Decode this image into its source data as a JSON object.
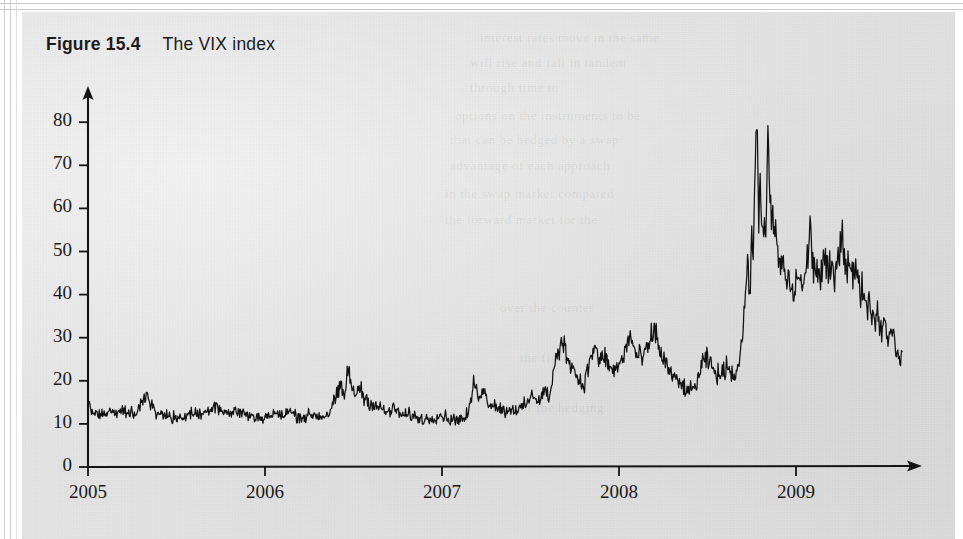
{
  "page": {
    "background_color": "#e3e3e3",
    "margin_color": "#ffffff",
    "ink_color": "#141414"
  },
  "figure": {
    "label": "Figure 15.4",
    "caption": "The VIX index"
  },
  "ghost_text": [
    {
      "text": "interest rates move in the same",
      "x": 480,
      "y": 30
    },
    {
      "text": "will rise and fall in tandem",
      "x": 470,
      "y": 55
    },
    {
      "text": "through time to",
      "x": 470,
      "y": 80
    },
    {
      "text": "options on the instruments to be",
      "x": 455,
      "y": 108
    },
    {
      "text": "that can be hedged by a swap",
      "x": 450,
      "y": 132
    },
    {
      "text": "advantage of each approach",
      "x": 450,
      "y": 158
    },
    {
      "text": "in the swap market compared",
      "x": 445,
      "y": 186
    },
    {
      "text": "the forward market for the",
      "x": 445,
      "y": 212
    },
    {
      "text": "over the counter",
      "x": 500,
      "y": 300
    },
    {
      "text": "the firm",
      "x": 520,
      "y": 350
    },
    {
      "text": "under the hedging",
      "x": 500,
      "y": 400
    }
  ],
  "chart_data": {
    "type": "line",
    "title": "The VIX index",
    "xlabel": "",
    "ylabel": "",
    "grid": false,
    "legend": null,
    "x_ticks": [
      "2005",
      "2006",
      "2007",
      "2008",
      "2009"
    ],
    "x_tick_values": [
      2005,
      2006,
      2007,
      2008,
      2009
    ],
    "y_ticks": [
      0,
      10,
      20,
      30,
      40,
      50,
      60,
      70,
      80
    ],
    "xlim": [
      2005.0,
      2009.6
    ],
    "ylim": [
      0,
      88
    ],
    "series_name": "VIX",
    "line_color": "#121212",
    "line_width": 1.3,
    "notes": [
      "Calm 2005-2006: VIX oscillates ~11-17",
      "June 2006 spike to ~24",
      "Feb-Mar 2007 spike to ~20",
      "Aug 2007 credit turmoil ~31",
      "Jan & Mar 2008 ~32-33",
      "mid-2008 lull ~17-18",
      "Sep-Nov 2008 crisis peak ~81",
      "2009 decline to ~25 by mid-year"
    ],
    "anchors": [
      {
        "x": 2005.0,
        "y": 14.1
      },
      {
        "x": 2005.04,
        "y": 12.3
      },
      {
        "x": 2005.08,
        "y": 11.6
      },
      {
        "x": 2005.12,
        "y": 12.8
      },
      {
        "x": 2005.17,
        "y": 12.0
      },
      {
        "x": 2005.21,
        "y": 13.2
      },
      {
        "x": 2005.26,
        "y": 12.1
      },
      {
        "x": 2005.3,
        "y": 14.5
      },
      {
        "x": 2005.34,
        "y": 16.5
      },
      {
        "x": 2005.38,
        "y": 13.2
      },
      {
        "x": 2005.42,
        "y": 12.1
      },
      {
        "x": 2005.47,
        "y": 11.5
      },
      {
        "x": 2005.51,
        "y": 11.2
      },
      {
        "x": 2005.55,
        "y": 11.9
      },
      {
        "x": 2005.6,
        "y": 12.6
      },
      {
        "x": 2005.64,
        "y": 12.0
      },
      {
        "x": 2005.68,
        "y": 13.4
      },
      {
        "x": 2005.72,
        "y": 14.6
      },
      {
        "x": 2005.77,
        "y": 12.8
      },
      {
        "x": 2005.81,
        "y": 12.4
      },
      {
        "x": 2005.85,
        "y": 13.1
      },
      {
        "x": 2005.9,
        "y": 12.0
      },
      {
        "x": 2005.94,
        "y": 11.6
      },
      {
        "x": 2006.0,
        "y": 11.5
      },
      {
        "x": 2006.05,
        "y": 12.4
      },
      {
        "x": 2006.09,
        "y": 11.8
      },
      {
        "x": 2006.14,
        "y": 12.9
      },
      {
        "x": 2006.18,
        "y": 11.9
      },
      {
        "x": 2006.23,
        "y": 11.6
      },
      {
        "x": 2006.27,
        "y": 12.2
      },
      {
        "x": 2006.32,
        "y": 11.7
      },
      {
        "x": 2006.36,
        "y": 12.4
      },
      {
        "x": 2006.4,
        "y": 16.0
      },
      {
        "x": 2006.43,
        "y": 18.5
      },
      {
        "x": 2006.45,
        "y": 15.9
      },
      {
        "x": 2006.47,
        "y": 24.0
      },
      {
        "x": 2006.49,
        "y": 17.8
      },
      {
        "x": 2006.51,
        "y": 16.4
      },
      {
        "x": 2006.53,
        "y": 18.9
      },
      {
        "x": 2006.56,
        "y": 16.2
      },
      {
        "x": 2006.6,
        "y": 14.8
      },
      {
        "x": 2006.64,
        "y": 13.9
      },
      {
        "x": 2006.69,
        "y": 12.6
      },
      {
        "x": 2006.73,
        "y": 13.5
      },
      {
        "x": 2006.78,
        "y": 11.8
      },
      {
        "x": 2006.82,
        "y": 12.2
      },
      {
        "x": 2006.86,
        "y": 11.4
      },
      {
        "x": 2006.91,
        "y": 11.0
      },
      {
        "x": 2006.95,
        "y": 11.6
      },
      {
        "x": 2007.0,
        "y": 12.1
      },
      {
        "x": 2007.05,
        "y": 10.9
      },
      {
        "x": 2007.09,
        "y": 11.3
      },
      {
        "x": 2007.13,
        "y": 11.0
      },
      {
        "x": 2007.16,
        "y": 14.0
      },
      {
        "x": 2007.18,
        "y": 20.3
      },
      {
        "x": 2007.2,
        "y": 16.4
      },
      {
        "x": 2007.23,
        "y": 18.2
      },
      {
        "x": 2007.26,
        "y": 15.1
      },
      {
        "x": 2007.31,
        "y": 14.2
      },
      {
        "x": 2007.35,
        "y": 13.0
      },
      {
        "x": 2007.4,
        "y": 13.6
      },
      {
        "x": 2007.44,
        "y": 13.2
      },
      {
        "x": 2007.48,
        "y": 14.8
      },
      {
        "x": 2007.52,
        "y": 16.9
      },
      {
        "x": 2007.55,
        "y": 15.2
      },
      {
        "x": 2007.58,
        "y": 18.0
      },
      {
        "x": 2007.61,
        "y": 16.0
      },
      {
        "x": 2007.64,
        "y": 24.5
      },
      {
        "x": 2007.66,
        "y": 26.2
      },
      {
        "x": 2007.68,
        "y": 30.8
      },
      {
        "x": 2007.7,
        "y": 26.0
      },
      {
        "x": 2007.73,
        "y": 24.4
      },
      {
        "x": 2007.76,
        "y": 21.0
      },
      {
        "x": 2007.8,
        "y": 19.0
      },
      {
        "x": 2007.83,
        "y": 23.5
      },
      {
        "x": 2007.86,
        "y": 28.5
      },
      {
        "x": 2007.89,
        "y": 24.0
      },
      {
        "x": 2007.92,
        "y": 26.0
      },
      {
        "x": 2007.95,
        "y": 22.5
      },
      {
        "x": 2007.99,
        "y": 22.8
      },
      {
        "x": 2008.03,
        "y": 26.0
      },
      {
        "x": 2008.06,
        "y": 31.0
      },
      {
        "x": 2008.09,
        "y": 26.5
      },
      {
        "x": 2008.13,
        "y": 25.0
      },
      {
        "x": 2008.17,
        "y": 28.0
      },
      {
        "x": 2008.2,
        "y": 32.2
      },
      {
        "x": 2008.23,
        "y": 27.0
      },
      {
        "x": 2008.27,
        "y": 23.5
      },
      {
        "x": 2008.31,
        "y": 20.5
      },
      {
        "x": 2008.36,
        "y": 18.8
      },
      {
        "x": 2008.4,
        "y": 17.2
      },
      {
        "x": 2008.44,
        "y": 19.5
      },
      {
        "x": 2008.47,
        "y": 23.8
      },
      {
        "x": 2008.5,
        "y": 25.0
      },
      {
        "x": 2008.54,
        "y": 22.0
      },
      {
        "x": 2008.58,
        "y": 21.0
      },
      {
        "x": 2008.61,
        "y": 24.0
      },
      {
        "x": 2008.64,
        "y": 21.5
      },
      {
        "x": 2008.67,
        "y": 22.5
      },
      {
        "x": 2008.7,
        "y": 31.0
      },
      {
        "x": 2008.72,
        "y": 45.0
      },
      {
        "x": 2008.74,
        "y": 42.0
      },
      {
        "x": 2008.75,
        "y": 55.0
      },
      {
        "x": 2008.76,
        "y": 48.0
      },
      {
        "x": 2008.77,
        "y": 70.0
      },
      {
        "x": 2008.78,
        "y": 81.0
      },
      {
        "x": 2008.79,
        "y": 57.0
      },
      {
        "x": 2008.8,
        "y": 69.0
      },
      {
        "x": 2008.81,
        "y": 53.0
      },
      {
        "x": 2008.82,
        "y": 60.0
      },
      {
        "x": 2008.83,
        "y": 49.0
      },
      {
        "x": 2008.84,
        "y": 81.5
      },
      {
        "x": 2008.85,
        "y": 62.0
      },
      {
        "x": 2008.86,
        "y": 55.0
      },
      {
        "x": 2008.87,
        "y": 60.0
      },
      {
        "x": 2008.88,
        "y": 52.0
      },
      {
        "x": 2008.89,
        "y": 54.0
      },
      {
        "x": 2008.91,
        "y": 45.0
      },
      {
        "x": 2008.93,
        "y": 48.0
      },
      {
        "x": 2008.95,
        "y": 41.0
      },
      {
        "x": 2008.96,
        "y": 44.0
      },
      {
        "x": 2008.98,
        "y": 40.0
      },
      {
        "x": 2009.0,
        "y": 42.0
      },
      {
        "x": 2009.02,
        "y": 45.5
      },
      {
        "x": 2009.04,
        "y": 41.0
      },
      {
        "x": 2009.06,
        "y": 46.0
      },
      {
        "x": 2009.08,
        "y": 56.0
      },
      {
        "x": 2009.1,
        "y": 45.0
      },
      {
        "x": 2009.12,
        "y": 47.0
      },
      {
        "x": 2009.14,
        "y": 43.0
      },
      {
        "x": 2009.16,
        "y": 49.0
      },
      {
        "x": 2009.18,
        "y": 44.0
      },
      {
        "x": 2009.2,
        "y": 46.5
      },
      {
        "x": 2009.22,
        "y": 42.0
      },
      {
        "x": 2009.24,
        "y": 52.0
      },
      {
        "x": 2009.26,
        "y": 54.0
      },
      {
        "x": 2009.28,
        "y": 47.0
      },
      {
        "x": 2009.3,
        "y": 49.0
      },
      {
        "x": 2009.32,
        "y": 44.0
      },
      {
        "x": 2009.34,
        "y": 46.0
      },
      {
        "x": 2009.36,
        "y": 40.0
      },
      {
        "x": 2009.38,
        "y": 42.0
      },
      {
        "x": 2009.4,
        "y": 37.0
      },
      {
        "x": 2009.42,
        "y": 38.5
      },
      {
        "x": 2009.44,
        "y": 34.0
      },
      {
        "x": 2009.46,
        "y": 36.0
      },
      {
        "x": 2009.48,
        "y": 32.0
      },
      {
        "x": 2009.5,
        "y": 34.0
      },
      {
        "x": 2009.52,
        "y": 30.0
      },
      {
        "x": 2009.54,
        "y": 33.0
      },
      {
        "x": 2009.56,
        "y": 28.0
      },
      {
        "x": 2009.58,
        "y": 26.5
      },
      {
        "x": 2009.6,
        "y": 25.2
      }
    ]
  },
  "axes": {
    "origin_px": {
      "x": 88,
      "y": 467
    },
    "y_top_px": 88,
    "x_right_px": 922,
    "px_per_year": 177.0,
    "px_per_10_units": 43.1,
    "arrowheads": [
      "y-axis-up",
      "x-axis-right"
    ]
  }
}
